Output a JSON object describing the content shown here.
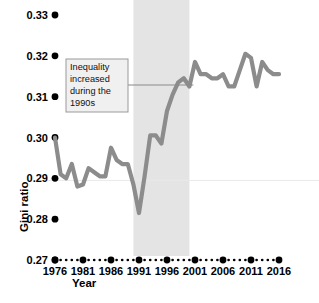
{
  "chart_data": {
    "type": "line",
    "title": "",
    "subtitle": "",
    "xlabel": "Year",
    "ylabel": "Gini ratio",
    "xlim": [
      1976,
      2016
    ],
    "ylim": [
      0.27,
      0.335
    ],
    "grid": false,
    "legend": "none",
    "line_color": "#8c8c8c",
    "tick_dot_color": "#000000",
    "band_color": "#e4e4e4",
    "annotation_box_color": "#f0f0f0",
    "annotation_border_color": "#9a9a9a",
    "yticks": [
      0.27,
      0.28,
      0.29,
      0.3,
      0.31,
      0.32,
      0.33
    ],
    "ytick_labels": [
      "0.27",
      "0.28",
      "0.29",
      "0.30",
      "0.31",
      "0.32",
      "0.33"
    ],
    "xticks": [
      1976,
      1981,
      1986,
      1991,
      1996,
      2001,
      2006,
      2011,
      2016
    ],
    "xtick_labels": [
      "1976",
      "1981",
      "1986",
      "1991",
      "1996",
      "2001",
      "2006",
      "2011",
      "2016"
    ],
    "shaded_band": {
      "x0": 1990,
      "x1": 2000,
      "label": "1990s"
    },
    "annotations": [
      {
        "id": "annot-1990s",
        "lines": [
          "Inequality",
          "increased",
          "during the",
          "1990s"
        ],
        "text": "Inequality increased during the 1990s"
      }
    ],
    "x": [
      1976,
      1977,
      1978,
      1979,
      1980,
      1981,
      1982,
      1983,
      1984,
      1985,
      1986,
      1987,
      1988,
      1989,
      1990,
      1991,
      1992,
      1993,
      1994,
      1995,
      1996,
      1997,
      1998,
      1999,
      2000,
      2001,
      2002,
      2003,
      2004,
      2005,
      2006,
      2007,
      2008,
      2009,
      2010,
      2011,
      2012,
      2013,
      2014,
      2015,
      2016
    ],
    "values": [
      0.3,
      0.291,
      0.29,
      0.2935,
      0.288,
      0.2885,
      0.2925,
      0.2915,
      0.2905,
      0.2905,
      0.2975,
      0.2945,
      0.2935,
      0.2935,
      0.2885,
      0.2815,
      0.2905,
      0.3005,
      0.3005,
      0.2985,
      0.3065,
      0.3105,
      0.3135,
      0.3145,
      0.3125,
      0.3185,
      0.3155,
      0.3155,
      0.3145,
      0.3145,
      0.3155,
      0.3125,
      0.3125,
      0.3165,
      0.3205,
      0.3195,
      0.3125,
      0.3185,
      0.3165,
      0.3155,
      0.3155
    ],
    "series_name": "Gini ratio"
  }
}
